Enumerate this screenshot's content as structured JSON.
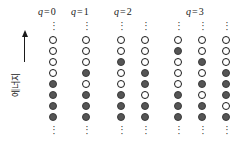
{
  "figure": {
    "axis": {
      "label": "에너지",
      "arrow_direction": "up",
      "arrow_icon": "up-arrow-icon"
    },
    "ellipsis_glyph": "·",
    "legend_meaning": {
      "open": "unoccupied state",
      "filled": "occupied state"
    },
    "colors": {
      "ink": "#1a1a1a",
      "filled_circle": "#555555",
      "open_circle": "#ffffff",
      "background": "#ffffff"
    },
    "groups": [
      {
        "id": "q0",
        "label_q": "q",
        "label_eq": "=",
        "label_value": "0",
        "label_text": "q = 0",
        "left": 45,
        "label_left": 38,
        "columns": [
          {
            "id": "q0-c1",
            "left": 47,
            "states": [
              "open",
              "open",
              "open",
              "open",
              "filled",
              "filled",
              "filled",
              "filled"
            ]
          }
        ]
      },
      {
        "id": "q1",
        "label_q": "q",
        "label_eq": "=",
        "label_value": "1",
        "label_text": "q = 1",
        "left": 78,
        "label_left": 71,
        "columns": [
          {
            "id": "q1-c1",
            "left": 80,
            "states": [
              "open",
              "open",
              "open",
              "filled",
              "open",
              "filled",
              "filled",
              "filled"
            ]
          }
        ]
      },
      {
        "id": "q2",
        "label_q": "q",
        "label_eq": "=",
        "label_value": "2",
        "label_text": "q = 2",
        "left": 115,
        "label_left": 114,
        "columns": [
          {
            "id": "q2-c1",
            "left": 115,
            "states": [
              "open",
              "open",
              "filled",
              "open",
              "open",
              "filled",
              "filled",
              "filled"
            ]
          },
          {
            "id": "q2-c2",
            "left": 139,
            "states": [
              "open",
              "open",
              "open",
              "filled",
              "filled",
              "open",
              "filled",
              "filled"
            ]
          }
        ]
      },
      {
        "id": "q3",
        "label_q": "q",
        "label_eq": "=",
        "label_value": "3",
        "label_text": "q = 3",
        "left": 172,
        "label_left": 186,
        "columns": [
          {
            "id": "q3-c1",
            "left": 172,
            "states": [
              "open",
              "filled",
              "open",
              "open",
              "open",
              "filled",
              "filled",
              "filled"
            ]
          },
          {
            "id": "q3-c2",
            "left": 196,
            "states": [
              "open",
              "open",
              "filled",
              "open",
              "filled",
              "open",
              "filled",
              "filled"
            ]
          },
          {
            "id": "q3-c3",
            "left": 220,
            "states": [
              "open",
              "open",
              "open",
              "filled",
              "filled",
              "filled",
              "open",
              "filled"
            ]
          }
        ]
      }
    ]
  }
}
